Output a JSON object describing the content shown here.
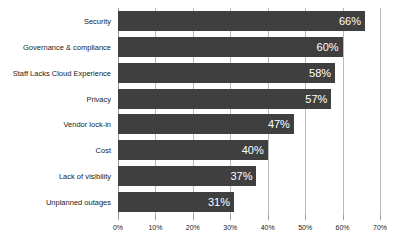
{
  "chart_data": {
    "type": "bar",
    "orientation": "horizontal",
    "title": "",
    "subtitle": "",
    "xlabel": "",
    "ylabel": "",
    "xlim": [
      0,
      70
    ],
    "xtick_step": 10,
    "grid": true,
    "legend": false,
    "value_suffix": "%",
    "categories": [
      "Security",
      "Governance & compliance",
      "Staff Lacks Cloud Experience",
      "Privacy",
      "Vendor lock-in",
      "Cost",
      "Lack of visibility",
      "Unplanned outages"
    ],
    "values": [
      66,
      60,
      58,
      57,
      47,
      40,
      37,
      31
    ],
    "data_labels": [
      "66%",
      "60%",
      "58%",
      "57%",
      "47%",
      "40%",
      "37%",
      "31%"
    ],
    "xtick_labels": [
      "0%",
      "10%",
      "20%",
      "30%",
      "40%",
      "50%",
      "60%",
      "70%"
    ],
    "xtick_values": [
      0,
      10,
      20,
      30,
      40,
      50,
      60,
      70
    ],
    "colors": {
      "bar": "#3f3f3f",
      "data_label": "#ffffff",
      "gridline": "#b9b9b9",
      "axis": "#9a9a9a",
      "text": "#222222",
      "background": "#ffffff"
    }
  }
}
